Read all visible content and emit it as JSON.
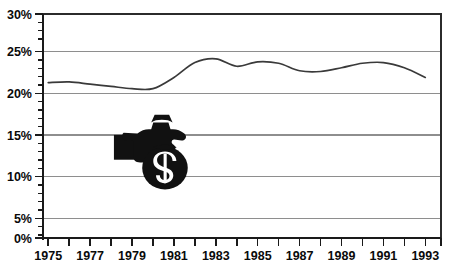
{
  "chart_data": {
    "type": "line",
    "title": "",
    "subtitle": "",
    "xlabel": "",
    "ylabel": "",
    "grid": "horizontal",
    "legend": "none",
    "xlim": [
      1975,
      1994
    ],
    "ylim": [
      0,
      30
    ],
    "y_tick_suffix": "%",
    "y_ticks": [
      0,
      5,
      10,
      15,
      20,
      25,
      30
    ],
    "y_tick_labels": [
      "0%",
      "5%",
      "10%",
      "15%",
      "20%",
      "25%",
      "30%"
    ],
    "y_minor_tick_step": 1,
    "x_ticks": [
      1975,
      1976,
      1977,
      1978,
      1979,
      1980,
      1981,
      1982,
      1983,
      1984,
      1985,
      1986,
      1987,
      1988,
      1989,
      1990,
      1991,
      1992,
      1993,
      1994
    ],
    "x_tick_labels": [
      "1975",
      "",
      "1977",
      "",
      "1979",
      "",
      "1981",
      "",
      "1983",
      "",
      "1985",
      "",
      "1987",
      "",
      "1989",
      "",
      "1991",
      "",
      "1993",
      ""
    ],
    "x_labeled_ticks": [
      "1975",
      "1977",
      "1979",
      "1981",
      "1983",
      "1985",
      "1987",
      "1989",
      "1991",
      "1993"
    ],
    "x": [
      1975,
      1976,
      1977,
      1978,
      1979,
      1980,
      1981,
      1982,
      1983,
      1984,
      1985,
      1986,
      1987,
      1988,
      1989,
      1990,
      1991,
      1992,
      1993
    ],
    "values": [
      20.8,
      20.9,
      20.6,
      20.3,
      20.0,
      20.0,
      21.5,
      23.5,
      24.0,
      23.0,
      23.6,
      23.4,
      22.4,
      22.3,
      22.8,
      23.4,
      23.5,
      22.8,
      21.5
    ],
    "series": [
      {
        "name": "",
        "color": "#3a3a3a",
        "values": [
          20.8,
          20.9,
          20.6,
          20.3,
          20.0,
          20.0,
          21.5,
          23.5,
          24.0,
          23.0,
          23.6,
          23.4,
          22.4,
          22.3,
          22.8,
          23.4,
          23.5,
          22.8,
          21.5
        ]
      }
    ],
    "annotations": [
      {
        "kind": "icon",
        "name": "money-bag-in-hand-icon",
        "x_year": 1980,
        "y_percent": 11.5,
        "color": "#111111"
      }
    ],
    "colors": {
      "line": "#3a3a3a",
      "grid": "#8e8e8e",
      "frame": "#2b2b2b",
      "axis": "#1a1a1a",
      "text": "#0a0a0a",
      "background": "#ffffff",
      "icon": "#111111"
    }
  }
}
